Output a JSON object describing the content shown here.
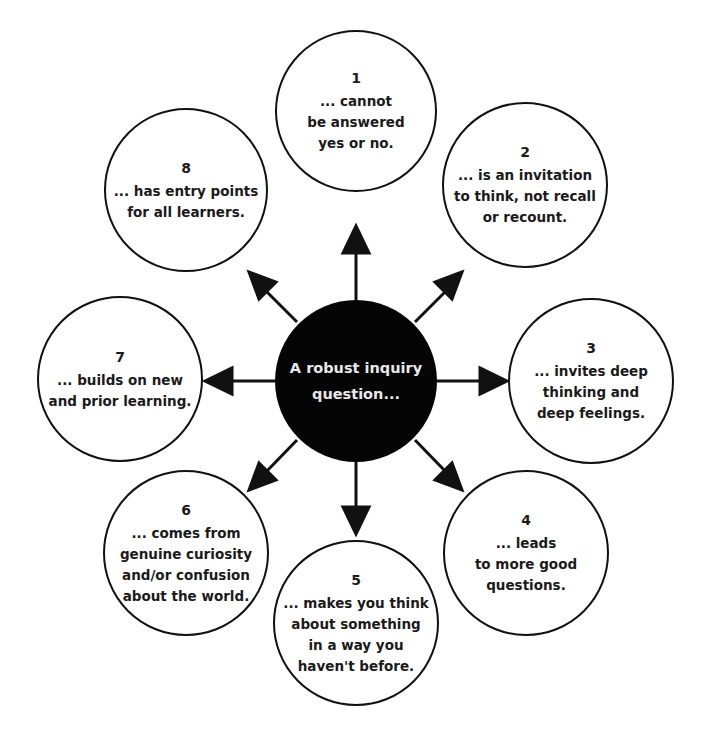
{
  "diagram": {
    "center": {
      "label": "A robust inquiry\nquestion..."
    },
    "nodes": [
      {
        "number": "1",
        "text": "... cannot\nbe answered\nyes or no."
      },
      {
        "number": "2",
        "text": "... is an invitation\nto think, not recall\nor recount."
      },
      {
        "number": "3",
        "text": "... invites deep\nthinking and\ndeep feelings."
      },
      {
        "number": "4",
        "text": "... leads\nto more good\nquestions."
      },
      {
        "number": "5",
        "text": "... makes you think\nabout something\nin a way you\nhaven't before."
      },
      {
        "number": "6",
        "text": "... comes from\ngenuine curiosity\nand/or confusion\nabout the world."
      },
      {
        "number": "7",
        "text": "... builds on new\nand prior learning."
      },
      {
        "number": "8",
        "text": "... has entry points\nfor all learners."
      }
    ],
    "colors": {
      "ink": "#111111",
      "center_fill": "#050505",
      "center_text": "#e9e9e9",
      "background": "#ffffff"
    }
  }
}
